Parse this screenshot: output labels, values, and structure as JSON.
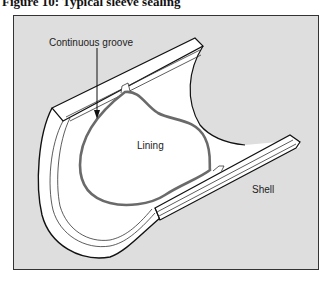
{
  "figure": {
    "title": "Figure 10: Typical sleeve sealing",
    "labels": {
      "groove": "Continuous groove",
      "lining": "Lining",
      "shell": "Shell"
    },
    "colors": {
      "background": "#dedede",
      "lining_stroke": "#6a6a6a",
      "outline": "#111111",
      "fill": "#ffffff"
    }
  }
}
